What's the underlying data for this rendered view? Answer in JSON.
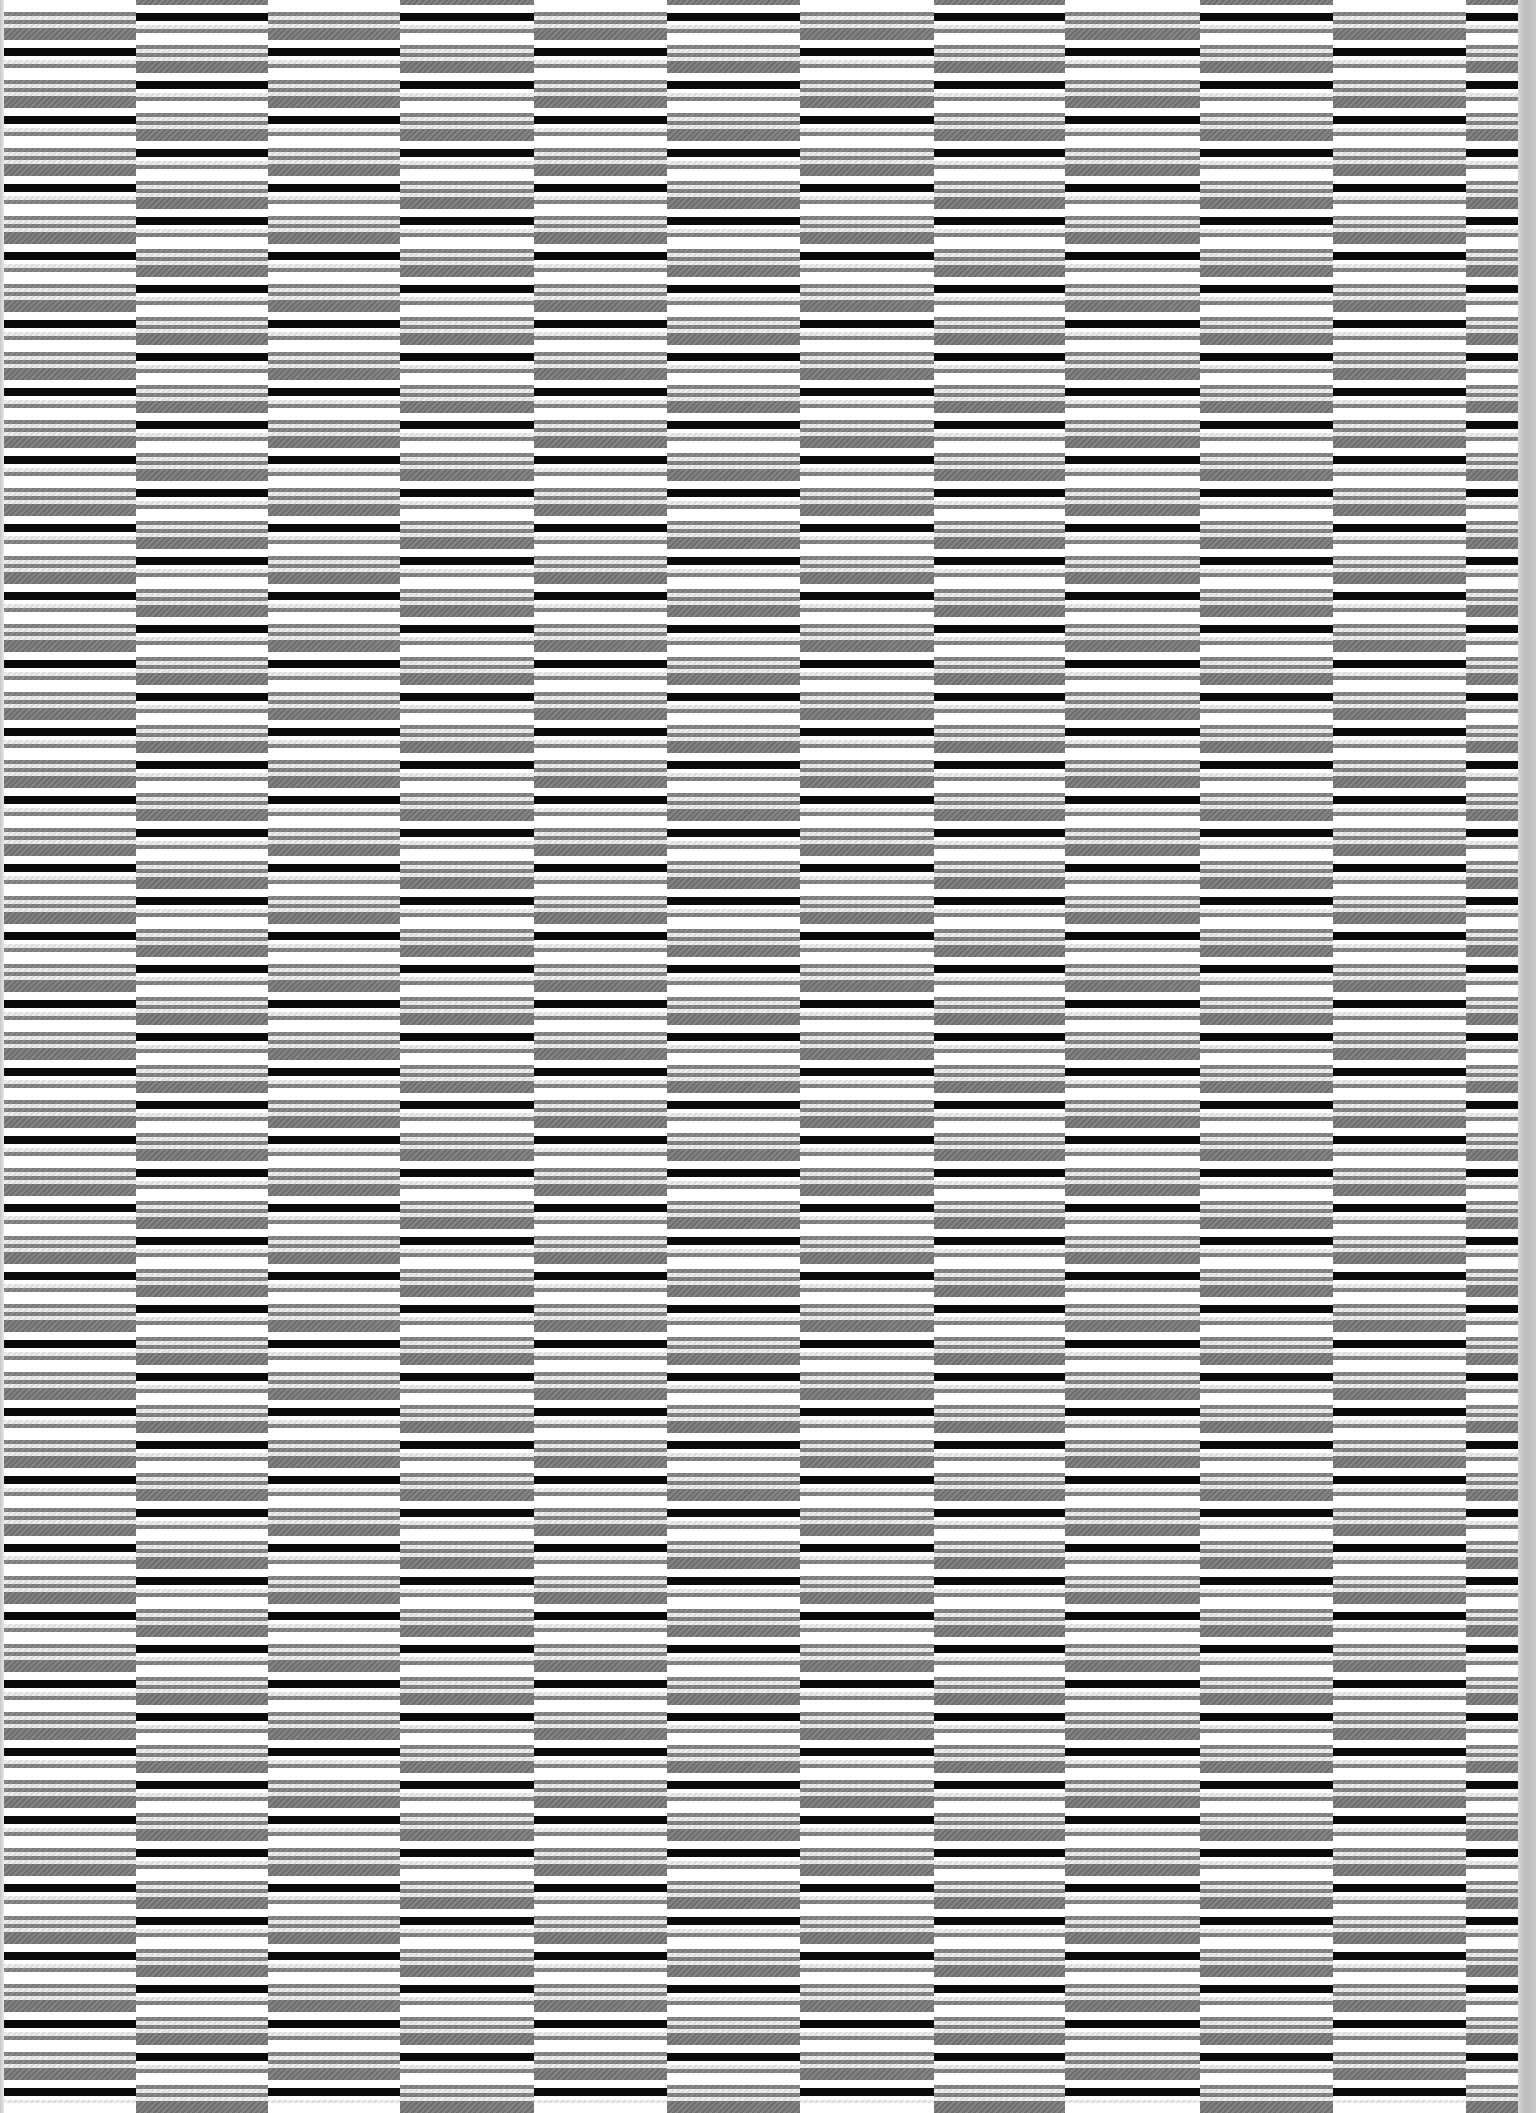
{
  "image": {
    "description": "Abstract striped texture: vertical columns of horizontal grey/black/white stripes, alternating columns offset by half a period",
    "width": 1536,
    "height": 2113
  },
  "colors": {
    "black": "#0a0a0a",
    "grey": "#7e7e7e",
    "dark_grey": "#777777",
    "light_hatch": "#e6e6e6",
    "white": "#ffffff",
    "margin": "#c4c4c4"
  },
  "pattern": {
    "period": 68,
    "bands": [
      {
        "type": "black",
        "offset": 0,
        "height": 4
      },
      {
        "type": "white",
        "offset": 4,
        "height": 4
      },
      {
        "type": "light",
        "offset": 8,
        "height": 4
      },
      {
        "type": "grey",
        "offset": 12,
        "height": 4
      },
      {
        "type": "white",
        "offset": 16,
        "height": 12
      },
      {
        "type": "grey",
        "offset": 28,
        "height": 4
      },
      {
        "type": "light",
        "offset": 32,
        "height": 4
      },
      {
        "type": "grey",
        "offset": 36,
        "height": 4
      },
      {
        "type": "light",
        "offset": 40,
        "height": 4
      },
      {
        "type": "dark",
        "offset": 44,
        "height": 12
      },
      {
        "type": "white",
        "offset": 56,
        "height": 8
      },
      {
        "type": "black",
        "offset": 64,
        "height": 4
      }
    ]
  },
  "columns": [
    {
      "x": 4,
      "width": 132,
      "phase": 52,
      "bottom": 2103
    },
    {
      "x": 136,
      "width": 132,
      "phase": 17,
      "bottom": 2113
    },
    {
      "x": 268,
      "width": 132,
      "phase": 52,
      "bottom": 2103
    },
    {
      "x": 400,
      "width": 134,
      "phase": 17,
      "bottom": 2113
    },
    {
      "x": 534,
      "width": 133,
      "phase": 52,
      "bottom": 2103
    },
    {
      "x": 667,
      "width": 133,
      "phase": 17,
      "bottom": 2113
    },
    {
      "x": 800,
      "width": 134,
      "phase": 52,
      "bottom": 2103
    },
    {
      "x": 934,
      "width": 131,
      "phase": 17,
      "bottom": 2113
    },
    {
      "x": 1065,
      "width": 135,
      "phase": 52,
      "bottom": 2103
    },
    {
      "x": 1200,
      "width": 133,
      "phase": 17,
      "bottom": 2113
    },
    {
      "x": 1333,
      "width": 133,
      "phase": 52,
      "bottom": 2103
    },
    {
      "x": 1466,
      "width": 52,
      "phase": 17,
      "bottom": 2113
    }
  ]
}
